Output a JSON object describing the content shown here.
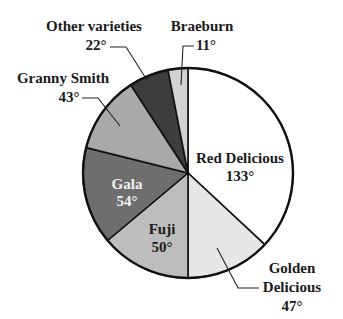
{
  "chart_data": {
    "type": "pie",
    "title": "",
    "unit": "degrees",
    "start_angle_deg": 0,
    "direction": "clockwise",
    "center": [
      188,
      173
    ],
    "radius": 105,
    "categories": [
      "Red Delicious",
      "Golden Delicious",
      "Fuji",
      "Gala",
      "Granny Smith",
      "Other varieties",
      "Braeburn"
    ],
    "values": [
      133,
      47,
      50,
      54,
      43,
      22,
      11
    ],
    "slices": [
      {
        "name": "Red Delicious",
        "value": 133,
        "label": "Red Delicious",
        "value_label": "133°",
        "color": "#ffffff",
        "label_position": "inside"
      },
      {
        "name": "Golden Delicious",
        "value": 47,
        "label": "Golden Delicious",
        "value_label": "47°",
        "color": "#e6e6e6",
        "label_position": "outside"
      },
      {
        "name": "Fuji",
        "value": 50,
        "label": "Fuji",
        "value_label": "50°",
        "color": "#bdbdbd",
        "label_position": "inside"
      },
      {
        "name": "Gala",
        "value": 54,
        "label": "Gala",
        "value_label": "54°",
        "color": "#6e6e6e",
        "label_position": "inside"
      },
      {
        "name": "Granny Smith",
        "value": 43,
        "label": "Granny Smith",
        "value_label": "43°",
        "color": "#a9a9a9",
        "label_position": "outside"
      },
      {
        "name": "Other varieties",
        "value": 22,
        "label": "Other varieties",
        "value_label": "22°",
        "color": "#3d3d3d",
        "label_position": "outside"
      },
      {
        "name": "Braeburn",
        "value": 11,
        "label": "Braeburn",
        "value_label": "11°",
        "color": "#d2d2d2",
        "label_position": "outside"
      }
    ],
    "legend": null,
    "total": 360
  },
  "labels": {
    "red_delicious": {
      "name": "Red Delicious",
      "value": "133°"
    },
    "golden_delicious": {
      "name_line1": "Golden",
      "name_line2": "Delicious",
      "value": "47°"
    },
    "fuji": {
      "name": "Fuji",
      "value": "50°"
    },
    "gala": {
      "name": "Gala",
      "value": "54°"
    },
    "granny_smith": {
      "name": "Granny Smith",
      "value": "43°"
    },
    "other_varieties": {
      "name": "Other varieties",
      "value": "22°"
    },
    "braeburn": {
      "name": "Braeburn",
      "value": "11°"
    }
  }
}
